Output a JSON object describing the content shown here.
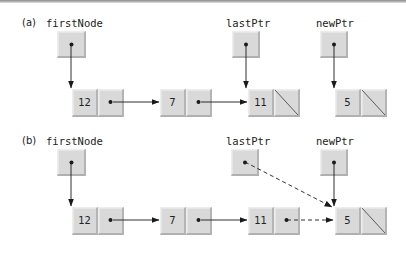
{
  "diagram": {
    "panels": [
      {
        "id": "a",
        "label": "(a)",
        "label_pos": [
          22,
          17
        ],
        "pointers": [
          {
            "id": "firstNode",
            "label": "firstNode",
            "label_pos": [
              46,
              17
            ],
            "box": [
              57,
              31,
              29,
              27
            ]
          },
          {
            "id": "lastPtr",
            "label": "lastPtr",
            "label_pos": [
              226,
              17
            ],
            "box": [
              232,
              31,
              28,
              27
            ]
          },
          {
            "id": "newPtr",
            "label": "newPtr",
            "label_pos": [
              316,
              17
            ],
            "box": [
              320,
              31,
              28,
              27
            ]
          }
        ],
        "nodes": [
          {
            "id": "n12",
            "value": "12",
            "x": 72,
            "y": 89,
            "next": "link"
          },
          {
            "id": "n7",
            "value": "7",
            "x": 160,
            "y": 89,
            "next": "link"
          },
          {
            "id": "n11",
            "value": "11",
            "x": 248,
            "y": 89,
            "next": "null"
          },
          {
            "id": "n5",
            "value": "5",
            "x": 335,
            "y": 89,
            "next": "null"
          }
        ]
      },
      {
        "id": "b",
        "label": "(b)",
        "label_pos": [
          22,
          135
        ],
        "pointers": [
          {
            "id": "firstNode",
            "label": "firstNode",
            "label_pos": [
              46,
              135
            ],
            "box": [
              57,
              149,
              29,
              27
            ]
          },
          {
            "id": "lastPtr",
            "label": "lastPtr",
            "label_pos": [
              226,
              135
            ],
            "box": [
              231,
              149,
              28,
              27
            ]
          },
          {
            "id": "newPtr",
            "label": "newPtr",
            "label_pos": [
              316,
              135
            ],
            "box": [
              320,
              149,
              28,
              27
            ]
          }
        ],
        "nodes": [
          {
            "id": "n12",
            "value": "12",
            "x": 72,
            "y": 207,
            "next": "link"
          },
          {
            "id": "n7",
            "value": "7",
            "x": 160,
            "y": 207,
            "next": "link"
          },
          {
            "id": "n11",
            "value": "11",
            "x": 248,
            "y": 207,
            "next": "link"
          },
          {
            "id": "n5",
            "value": "5",
            "x": 335,
            "y": 207,
            "next": "null"
          }
        ]
      }
    ],
    "edges": [
      {
        "panel": "a",
        "from": [
          71,
          44
        ],
        "to": [
          71,
          88
        ],
        "style": "solid"
      },
      {
        "panel": "a",
        "from": [
          113,
          102
        ],
        "to": [
          159,
          102
        ],
        "style": "solid"
      },
      {
        "panel": "a",
        "from": [
          201,
          102
        ],
        "to": [
          247,
          102
        ],
        "style": "solid"
      },
      {
        "panel": "a",
        "from": [
          246,
          44
        ],
        "to": [
          246,
          88
        ],
        "style": "solid"
      },
      {
        "panel": "a",
        "from": [
          334,
          44
        ],
        "to": [
          334,
          88
        ],
        "style": "solid"
      },
      {
        "panel": "b",
        "from": [
          71,
          162
        ],
        "to": [
          71,
          206
        ],
        "style": "solid"
      },
      {
        "panel": "b",
        "from": [
          113,
          220
        ],
        "to": [
          159,
          220
        ],
        "style": "solid"
      },
      {
        "panel": "b",
        "from": [
          201,
          220
        ],
        "to": [
          247,
          220
        ],
        "style": "solid"
      },
      {
        "panel": "b",
        "from": [
          334,
          162
        ],
        "to": [
          334,
          206
        ],
        "style": "solid"
      },
      {
        "panel": "b",
        "from": [
          245,
          162
        ],
        "to": [
          332,
          207
        ],
        "style": "dashed"
      },
      {
        "panel": "b",
        "from": [
          287,
          220
        ],
        "to": [
          333,
          220
        ],
        "style": "dashed"
      }
    ],
    "cell": {
      "width": 26,
      "height": 28
    },
    "colors": {
      "cell_fill": "#d9d9d9",
      "line": "#1a1a1a",
      "text": "#222222"
    }
  }
}
